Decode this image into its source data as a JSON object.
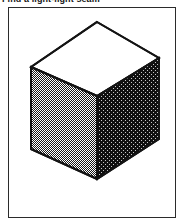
{
  "caption": {
    "text": "Find a light-light seam",
    "clipped": true
  },
  "figure": {
    "frame": {
      "x": 8,
      "y": 7,
      "width": 168,
      "height": 211,
      "border_color": "#2b2b2b",
      "background": "#ffffff"
    },
    "cube": {
      "description": "Isometric cube: white top face, medium-gray dithered left face, dark dithered right face",
      "vertices": {
        "top_apex": [
          88,
          14
        ],
        "left_upper": [
          22,
          59
        ],
        "right_upper": [
          150,
          50
        ],
        "front_upper": [
          88,
          88
        ],
        "left_lower": [
          22,
          141
        ],
        "right_lower": [
          150,
          131
        ],
        "front_lower": [
          88,
          171
        ]
      },
      "faces": [
        {
          "name": "top-face",
          "shade": "white",
          "fill": "#ffffff"
        },
        {
          "name": "left-face",
          "shade": "light-gray",
          "fill": "#a8a8a8"
        },
        {
          "name": "right-face",
          "shade": "dark",
          "fill": "#2e2e2e"
        }
      ],
      "outline_color": "#141414",
      "outline_width": 2
    }
  },
  "colors": {
    "ink": "#141414",
    "frame": "#2b2b2b",
    "face_top": "#ffffff",
    "face_left": "#a8a8a8",
    "face_right": "#2e2e2e",
    "page_background": "#ffffff"
  }
}
